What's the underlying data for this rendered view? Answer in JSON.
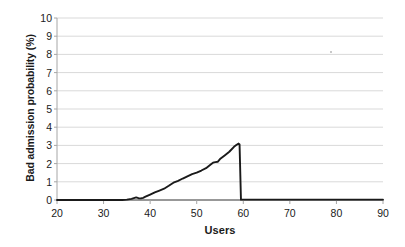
{
  "chart_data": {
    "type": "line",
    "title": "",
    "xlabel": "Users",
    "ylabel": "Bad admission probability (%)",
    "xlim": [
      20,
      90
    ],
    "ylim": [
      0,
      10
    ],
    "xticks": [
      20,
      30,
      40,
      50,
      60,
      70,
      80,
      90
    ],
    "yticks": [
      0,
      1,
      2,
      3,
      4,
      5,
      6,
      7,
      8,
      9,
      10
    ],
    "grid": "horizontal",
    "legend": "none",
    "series": [
      {
        "name": "Bad admission probability",
        "color": "#1a1a1a",
        "x": [
          20,
          24,
          28,
          32,
          34,
          35,
          36,
          37,
          37.5,
          38,
          38.5,
          39,
          40,
          41,
          42,
          43,
          44,
          45,
          46,
          47,
          48,
          49,
          50,
          51,
          52,
          53,
          53.5,
          54,
          54.5,
          55,
          56,
          57,
          58,
          58.5,
          59,
          59.2,
          59.5,
          60,
          62,
          66,
          70,
          75,
          80,
          85,
          90
        ],
        "y": [
          0,
          0,
          0,
          0,
          0,
          0.02,
          0.06,
          0.14,
          0.1,
          0.09,
          0.12,
          0.18,
          0.3,
          0.42,
          0.52,
          0.62,
          0.78,
          0.95,
          1.05,
          1.18,
          1.3,
          1.42,
          1.5,
          1.62,
          1.75,
          1.95,
          2.05,
          2.08,
          2.1,
          2.25,
          2.45,
          2.65,
          2.92,
          3.02,
          3.1,
          3.05,
          0.02,
          0.02,
          0.02,
          0.02,
          0.02,
          0.02,
          0.02,
          0.02,
          0.02
        ]
      }
    ],
    "annotations": [],
    "colors": {
      "line": "#1a1a1a",
      "grid": "#d9d9d9",
      "axis": "#a6a6a6",
      "baseline": "#333333",
      "text": "#1a1a1a",
      "background": "#ffffff"
    },
    "tick_labels": {
      "y": [
        "0",
        "1",
        "2",
        "3",
        "4",
        "5",
        "6",
        "7",
        "8",
        "9",
        "10"
      ],
      "x": [
        "20",
        "30",
        "40",
        "50",
        "60",
        "70",
        "80",
        "90"
      ]
    },
    "peak": {
      "x": 59,
      "y": 3.1
    },
    "artifact": {
      "name": "scan-speck",
      "x": 330,
      "y": 51
    }
  }
}
